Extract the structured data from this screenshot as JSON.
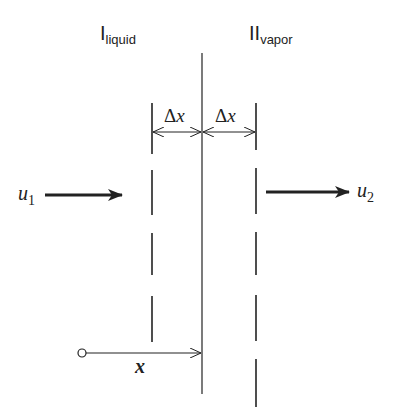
{
  "diagram": {
    "phase_left": {
      "main": "I",
      "sub": "liquid"
    },
    "phase_right": {
      "main": "II",
      "sub": "vapor"
    },
    "interface_label": "",
    "delta_left": {
      "symbol": "Δ",
      "var": "x"
    },
    "delta_right": {
      "symbol": "Δ",
      "var": "x"
    },
    "velocity_in": {
      "var": "u",
      "sub": "1"
    },
    "velocity_out": {
      "var": "u",
      "sub": "2"
    },
    "position": {
      "var": "x"
    },
    "colors": {
      "ink": "#222222",
      "background": "#ffffff"
    }
  }
}
